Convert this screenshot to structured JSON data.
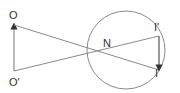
{
  "diagram": {
    "labels": {
      "object_top": "O",
      "object_bottom": "O'",
      "nodal_point": "N",
      "image_top": "I'",
      "image_bottom": "I"
    },
    "colors": {
      "stroke": "#8a8a8a",
      "arrow": "#333333",
      "text": "#333333"
    }
  }
}
